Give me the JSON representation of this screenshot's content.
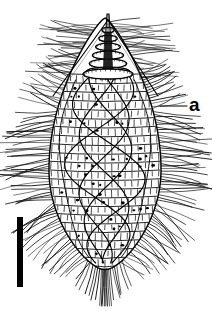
{
  "figure": {
    "kind": "scientific-line-drawing",
    "background_color": "#ffffff",
    "ink_color": "#000000",
    "labels": [
      {
        "id": "a",
        "text": "a",
        "x": 196,
        "y": 106,
        "leader_from_x": 160,
        "leader_to_x": 187,
        "leader_y": 106
      }
    ],
    "scale_bar": {
      "name": "scale-bar",
      "x": 17,
      "y": 217,
      "width": 6,
      "height": 70,
      "color": "#000000",
      "caption": ""
    },
    "body": {
      "center_x": 105,
      "top_y": 18,
      "bottom_y": 270,
      "max_half_width": 56,
      "widest_y": 170,
      "plate_rows": 22,
      "plates_per_row": 17,
      "kinety_lines": 5,
      "nuclei_dots": 58
    },
    "apex": {
      "tip_x": 108,
      "tip_y": 14,
      "rings": 6,
      "ring_top_y": 30,
      "ring_bottom_y": 72
    },
    "cilia": {
      "peripheral_count": 150,
      "trailing_count": 22,
      "apical_count": 60
    }
  },
  "chart_data": {
    "type": "table",
    "title": "",
    "note": "Not a data chart; scientific illustration."
  }
}
